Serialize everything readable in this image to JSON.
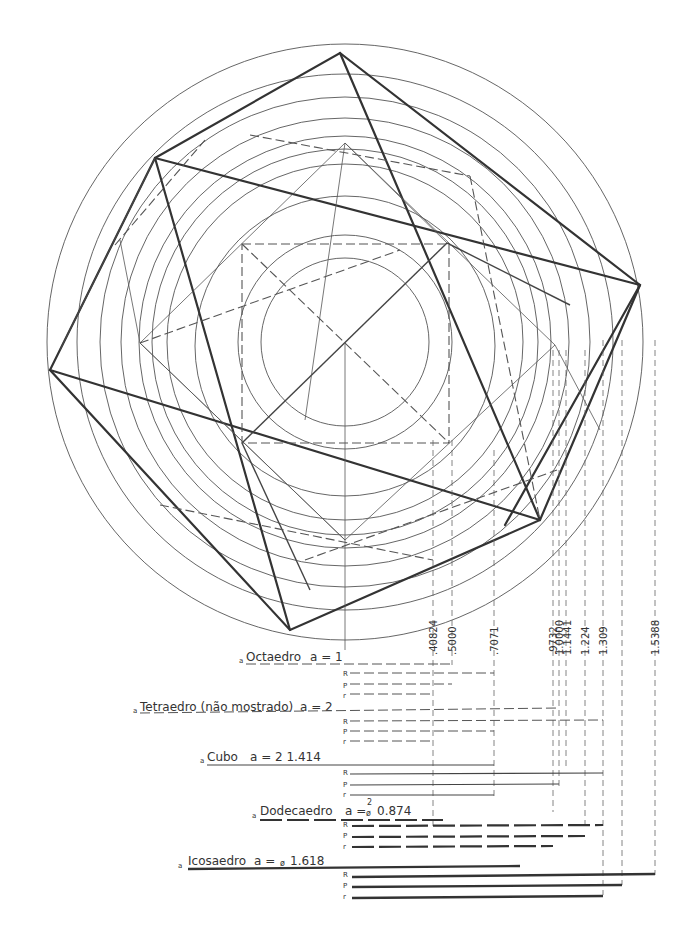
{
  "figure": {
    "center": [
      345,
      342
    ],
    "circles_radii": [
      298,
      268,
      245,
      224,
      206,
      193,
      176,
      124,
      107,
      92
    ],
    "guide_values": [
      {
        "label": ".40824",
        "x": 433
      },
      {
        "label": ".5000",
        "x": 452
      },
      {
        "label": ".7071",
        "x": 494
      },
      {
        "label": ".9732",
        "x": 553
      },
      {
        "label": "1.0000",
        "x": 559
      },
      {
        "label": "1.1441",
        "x": 566
      },
      {
        "label": "1.224",
        "x": 585
      },
      {
        "label": "1.309",
        "x": 603
      },
      {
        "label": "1.5388",
        "x": 655
      }
    ]
  },
  "legend": {
    "solids": [
      {
        "marker": "a",
        "name": "Octaedro",
        "formula": "a = 1",
        "rows": [
          "R",
          "P",
          "r"
        ]
      },
      {
        "marker": "a",
        "name": "Tetraedro (não mostrado)",
        "formula": "a = 2",
        "rows": [
          "R",
          "P",
          "r"
        ]
      },
      {
        "marker": "a",
        "name": "Cubo",
        "formula": "a = 2  1.414",
        "rows": [
          "R",
          "P",
          "r"
        ]
      },
      {
        "marker": "a",
        "name": "Dodecaedro",
        "formula_prefix": "a =",
        "formula_sup": "2",
        "formula_phi": "ø",
        "formula_value": "0.874",
        "rows": [
          "R",
          "P",
          "r"
        ]
      },
      {
        "marker": "a",
        "name": "Icosaedro",
        "formula_prefix": "a =",
        "formula_phi": "ø",
        "formula_value": "1.618",
        "rows": [
          "R",
          "P",
          "r"
        ]
      }
    ]
  }
}
